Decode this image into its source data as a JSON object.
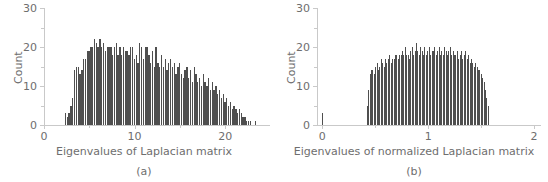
{
  "figure": {
    "background": "#ffffff",
    "bar_color": "#4f4f4f",
    "axis_color": "#c9c9c9",
    "text_color": "#6e6e6e"
  },
  "panels": [
    {
      "key": "a",
      "caption": "(a)"
    },
    {
      "key": "b",
      "caption": "(b)"
    }
  ],
  "chart_data": [
    {
      "type": "bar",
      "panel": "a",
      "title": "",
      "xlabel": "Eigenvalues of Laplacian matrix",
      "ylabel": "Count",
      "caption": "(a)",
      "grid": false,
      "legend": "none",
      "xlim": [
        0,
        24.5
      ],
      "ylim": [
        0,
        30
      ],
      "xticks": [
        0,
        10,
        20
      ],
      "xtick_labels": [
        "0",
        "10",
        "20"
      ],
      "xminor_ticks": [
        5,
        15
      ],
      "yticks": [
        0,
        10,
        20,
        30
      ],
      "ytick_labels": [
        "0",
        "10",
        "20",
        "30"
      ],
      "yminor_ticks": [
        5,
        15,
        25
      ],
      "bin_width": 0.2,
      "bin_starts": [
        2.3,
        2.5,
        2.7,
        2.9,
        3.1,
        3.3,
        3.5,
        3.7,
        3.9,
        4.1,
        4.3,
        4.5,
        4.7,
        4.9,
        5.1,
        5.3,
        5.5,
        5.7,
        5.9,
        6.1,
        6.3,
        6.5,
        6.7,
        6.9,
        7.1,
        7.3,
        7.5,
        7.7,
        7.9,
        8.1,
        8.3,
        8.5,
        8.7,
        8.9,
        9.1,
        9.3,
        9.5,
        9.7,
        9.9,
        10.1,
        10.3,
        10.5,
        10.7,
        10.9,
        11.1,
        11.3,
        11.5,
        11.7,
        11.9,
        12.1,
        12.3,
        12.5,
        12.7,
        12.9,
        13.1,
        13.3,
        13.5,
        13.7,
        13.9,
        14.1,
        14.3,
        14.5,
        14.7,
        14.9,
        15.1,
        15.3,
        15.5,
        15.7,
        15.9,
        16.1,
        16.3,
        16.5,
        16.7,
        16.9,
        17.1,
        17.3,
        17.5,
        17.7,
        17.9,
        18.1,
        18.3,
        18.5,
        18.7,
        18.9,
        19.1,
        19.3,
        19.5,
        19.7,
        19.9,
        20.1,
        20.3,
        20.5,
        20.7,
        20.9,
        21.1,
        21.3,
        21.5,
        21.7,
        21.9,
        22.1,
        22.3,
        22.5,
        22.7,
        22.9,
        23.1,
        23.3
      ],
      "counts": [
        3,
        2,
        3,
        5,
        7,
        14,
        15,
        15,
        13,
        14,
        17,
        17,
        19,
        19,
        20,
        20,
        22,
        21,
        20,
        22,
        20,
        21,
        19,
        20,
        20,
        20,
        18,
        20,
        21,
        18,
        20,
        18,
        20,
        19,
        19,
        18,
        20,
        20,
        17,
        18,
        16,
        21,
        20,
        17,
        20,
        20,
        18,
        16,
        19,
        15,
        20,
        16,
        15,
        18,
        15,
        17,
        14,
        16,
        17,
        15,
        16,
        13,
        15,
        16,
        13,
        12,
        14,
        15,
        12,
        14,
        11,
        15,
        13,
        11,
        12,
        10,
        13,
        11,
        10,
        12,
        9,
        11,
        9,
        10,
        8,
        9,
        7,
        8,
        6,
        7,
        5,
        6,
        4,
        5,
        4,
        3,
        4,
        3,
        2,
        2,
        1,
        1,
        1,
        0,
        0,
        1
      ]
    },
    {
      "type": "bar",
      "panel": "b",
      "title": "",
      "xlabel": "Eigenvalues of normalized Laplacian matrix",
      "ylabel": "Count",
      "caption": "(b)",
      "grid": false,
      "legend": "none",
      "xlim": [
        -0.05,
        2.0
      ],
      "ylim": [
        0,
        30
      ],
      "xticks": [
        0,
        1,
        2
      ],
      "xtick_labels": [
        "0",
        "1",
        "2"
      ],
      "xminor_ticks": [
        0.5,
        1.5
      ],
      "yticks": [
        0,
        10,
        20,
        30
      ],
      "ytick_labels": [
        "0",
        "10",
        "20",
        "30"
      ],
      "yminor_ticks": [
        5,
        15,
        25
      ],
      "bin_width": 0.0133,
      "bin_starts": [
        0.0,
        0.42,
        0.4333,
        0.4466,
        0.4599,
        0.4732,
        0.4865,
        0.4998,
        0.5131,
        0.5264,
        0.5397,
        0.553,
        0.5663,
        0.5796,
        0.5929,
        0.6062,
        0.6195,
        0.6328,
        0.6461,
        0.6594,
        0.6727,
        0.686,
        0.6993,
        0.7126,
        0.7259,
        0.7392,
        0.7525,
        0.7658,
        0.7791,
        0.7924,
        0.8057,
        0.819,
        0.8323,
        0.8456,
        0.8589,
        0.8722,
        0.8855,
        0.8988,
        0.9121,
        0.9254,
        0.9387,
        0.952,
        0.9653,
        0.9786,
        0.9919,
        1.0052,
        1.0185,
        1.0318,
        1.0451,
        1.0584,
        1.0717,
        1.085,
        1.0983,
        1.1116,
        1.1249,
        1.1382,
        1.1515,
        1.1648,
        1.1781,
        1.1914,
        1.2047,
        1.218,
        1.2313,
        1.2446,
        1.2579,
        1.2712,
        1.2845,
        1.2978,
        1.3111,
        1.3244,
        1.3377,
        1.351,
        1.3643,
        1.3776,
        1.3909,
        1.4042,
        1.4175,
        1.4308,
        1.4441,
        1.4574,
        1.4707,
        1.484,
        1.4973,
        1.5106,
        1.5239,
        1.5372,
        1.5505,
        1.5638
      ],
      "counts": [
        3,
        5,
        9,
        13,
        14,
        14,
        13,
        15,
        16,
        14,
        15,
        17,
        16,
        15,
        17,
        16,
        17,
        18,
        16,
        17,
        17,
        18,
        18,
        17,
        18,
        18,
        19,
        18,
        20,
        18,
        18,
        17,
        19,
        20,
        18,
        19,
        21,
        19,
        18,
        20,
        19,
        18,
        20,
        18,
        19,
        20,
        18,
        19,
        19,
        20,
        18,
        19,
        20,
        18,
        19,
        18,
        20,
        19,
        18,
        19,
        20,
        18,
        19,
        18,
        18,
        19,
        17,
        18,
        19,
        17,
        18,
        19,
        17,
        18,
        16,
        17,
        16,
        15,
        16,
        15,
        14,
        14,
        13,
        12,
        11,
        9,
        7,
        5
      ]
    }
  ]
}
